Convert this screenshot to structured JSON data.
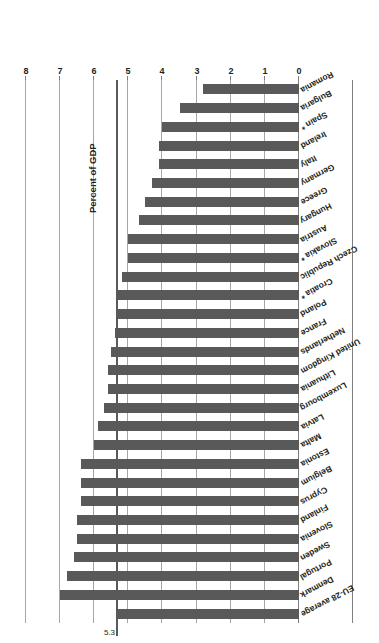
{
  "chart_data": {
    "type": "bar",
    "orientation": "horizontal",
    "title": "",
    "xlabel": "Percent of GDP",
    "ylabel": "",
    "xlim": [
      0,
      8
    ],
    "xticks": [
      "0",
      "1",
      "2",
      "3",
      "4",
      "5",
      "6",
      "7",
      "8"
    ],
    "grid": true,
    "legend": false,
    "bar_color": "#595959",
    "reference_line": {
      "label": "5.3",
      "value": 5.3,
      "color": "#595959"
    },
    "categories": [
      "EU-28 average",
      "Denmark",
      "Portugal",
      "Sweden",
      "Slovenia",
      "Finland",
      "Cyprus",
      "Belgium",
      "Estonia",
      "Malta",
      "Latvia",
      "Luxembourg",
      "Lithuania",
      "United Kingdom",
      "Netherlands",
      "France",
      "Poland",
      "Croatia *",
      "Czech Republic",
      "Slovakia *",
      "Austria",
      "Hungary",
      "Greece",
      "Germany",
      "Italy",
      "Ireland",
      "Spain *",
      "Bulgaria",
      "Romania"
    ],
    "values": [
      5.3,
      7.0,
      6.8,
      6.6,
      6.5,
      6.5,
      6.4,
      6.4,
      6.4,
      6.0,
      5.9,
      5.7,
      5.6,
      5.6,
      5.5,
      5.4,
      5.3,
      5.3,
      5.2,
      5.0,
      5.0,
      4.7,
      4.5,
      4.3,
      4.1,
      4.1,
      4.0,
      3.5,
      2.8
    ]
  },
  "figure": {
    "axis_title": "Percent of GDP",
    "reference_value_label": "5.3"
  }
}
